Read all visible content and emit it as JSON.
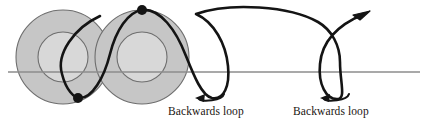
{
  "figure": {
    "background_color": "#ffffff",
    "baseline": {
      "name": "ground-line",
      "color": "#8c8c8c",
      "x_start": 8,
      "x_end": 420,
      "y": 72,
      "stroke_width": 1.4
    },
    "wheels": [
      {
        "label": "left-wheel",
        "cx": 63,
        "cy": 57,
        "r": 47,
        "fill": "#c6c6c6",
        "stroke": "#6e6e6e",
        "inner_r": 25,
        "inner_fill": "#d8d8d8"
      },
      {
        "label": "right-wheel",
        "cx": 142,
        "cy": 57,
        "r": 47,
        "fill": "#c6c6c6",
        "stroke": "#6e6e6e",
        "inner_r": 25,
        "inner_fill": "#d8d8d8"
      }
    ],
    "trace_curve": {
      "name": "trochoid-path",
      "color": "#141414",
      "stroke_width": 2.6,
      "loops": 2,
      "arrow_at_end": true
    },
    "markers": [
      {
        "label": "upper-point",
        "cx": 142,
        "cy": 10,
        "r": 5,
        "fill": "#141414"
      },
      {
        "label": "lower-point",
        "cx": 78,
        "cy": 98,
        "r": 5,
        "fill": "#141414"
      }
    ],
    "annotations": [
      {
        "label": "Backwards loop",
        "text_x": 168,
        "text_y": 112,
        "arrow_cx": 212,
        "arrow_cy": 100,
        "direction": "counterclockwise"
      },
      {
        "label": "Backwards loop",
        "text_x": 293,
        "text_y": 112,
        "arrow_cx": 337,
        "arrow_cy": 100,
        "direction": "counterclockwise"
      }
    ]
  },
  "labels": {
    "backwards_loop_left": "Backwards loop",
    "backwards_loop_right": "Backwards loop"
  },
  "colors": {
    "wheel_fill": "#c6c6c6",
    "wheel_inner_fill": "#d8d8d8",
    "wheel_stroke": "#6e6e6e",
    "curve": "#141414",
    "baseline": "#8c8c8c",
    "text": "#1a1510"
  }
}
